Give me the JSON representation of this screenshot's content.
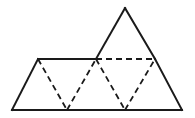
{
  "figure": {
    "name": "triangle-net-diagram",
    "canvas": {
      "width": 195,
      "height": 118
    },
    "colors": {
      "background": "#ffffff",
      "stroke": "#1a1a1a"
    },
    "stroke_widths": {
      "solid": 2.0,
      "dashed": 1.8
    },
    "dash_pattern": "6,4",
    "vertices": {
      "bottom_left": {
        "x": 12,
        "y": 110
      },
      "bottom_mid_left": {
        "x": 67,
        "y": 110
      },
      "bottom_mid_right": {
        "x": 125,
        "y": 110
      },
      "bottom_right": {
        "x": 182,
        "y": 110
      },
      "mid_left": {
        "x": 38,
        "y": 59
      },
      "mid_center": {
        "x": 96,
        "y": 59
      },
      "mid_right": {
        "x": 155,
        "y": 59
      },
      "apex": {
        "x": 125,
        "y": 8
      }
    },
    "solid_edges": [
      {
        "name": "bottom-edge",
        "d": "M 12 110 L 182 110"
      },
      {
        "name": "left-slant-edge",
        "d": "M 12 110 L 38 59"
      },
      {
        "name": "top-left-horizontal-edge",
        "d": "M 38 59 L 96 59"
      },
      {
        "name": "apex-left-edge",
        "d": "M 96 59 L 125 8"
      },
      {
        "name": "apex-right-edge",
        "d": "M 125 8 L 155 59"
      },
      {
        "name": "right-slant-edge",
        "d": "M 155 59 L 182 110"
      }
    ],
    "dashed_edges": [
      {
        "name": "fold-line-1",
        "d": "M 38 59 L 67 110"
      },
      {
        "name": "fold-line-2",
        "d": "M 67 110 L 96 59"
      },
      {
        "name": "fold-line-3",
        "d": "M 96 59 L 125 110"
      },
      {
        "name": "fold-line-4",
        "d": "M 125 110 L 155 59"
      },
      {
        "name": "fold-line-horizontal",
        "d": "M 96 59 L 155 59"
      }
    ]
  }
}
